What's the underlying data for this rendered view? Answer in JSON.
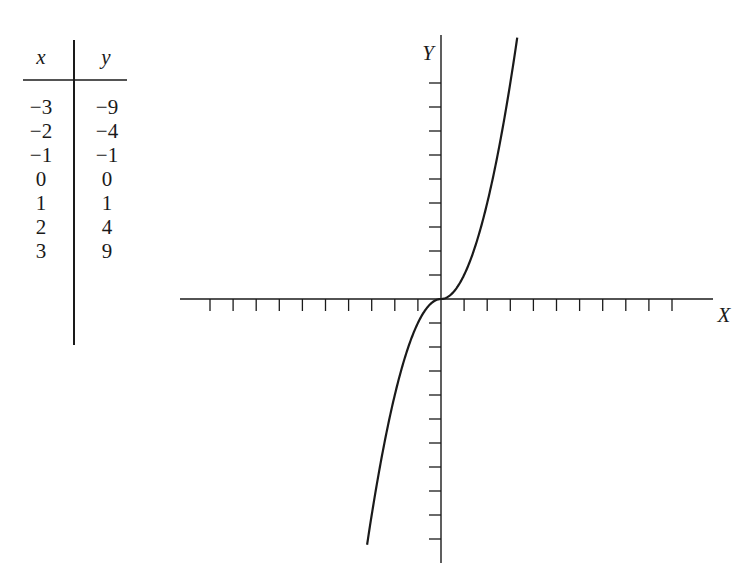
{
  "table": {
    "headers": {
      "x": "x",
      "y": "y"
    },
    "rows": [
      {
        "x": "−3",
        "y": "−9"
      },
      {
        "x": "−2",
        "y": "−4"
      },
      {
        "x": "−1",
        "y": "−1"
      },
      {
        "x": "0",
        "y": "0"
      },
      {
        "x": "1",
        "y": "1"
      },
      {
        "x": "2",
        "y": "4"
      },
      {
        "x": "3",
        "y": "9"
      }
    ]
  },
  "axes": {
    "x_label": "X",
    "y_label": "Y",
    "origin_px": [
      441,
      299
    ],
    "unit_px_x": 23.1,
    "unit_px_y": 24,
    "x_ticks_left": 10,
    "x_ticks_right": 10,
    "y_ticks_up": 9,
    "y_ticks_down": 10,
    "x_extent_px": [
      180,
      713
    ],
    "y_extent_px": [
      35,
      563
    ]
  },
  "colors": {
    "ink": "#1a1a1a",
    "background": "#ffffff"
  },
  "chart_data": {
    "type": "line",
    "title": "",
    "xlabel": "X",
    "ylabel": "Y",
    "function": "y = x|x|",
    "table_points": {
      "x": [
        -3,
        -2,
        -1,
        0,
        1,
        2,
        3
      ],
      "y": [
        -9,
        -4,
        -1,
        0,
        1,
        4,
        9
      ]
    },
    "series": [
      {
        "name": "curve",
        "x": [
          -3.2,
          -3,
          -2,
          -1,
          0,
          1,
          2,
          3,
          3.3
        ],
        "y": [
          -10.24,
          -9,
          -4,
          -1,
          0,
          1,
          4,
          9,
          10.89
        ]
      }
    ],
    "xlim": [
      -11,
      11.8
    ],
    "ylim": [
      -11,
      11
    ],
    "grid": false,
    "tick_labels": "none",
    "legend": "none"
  }
}
